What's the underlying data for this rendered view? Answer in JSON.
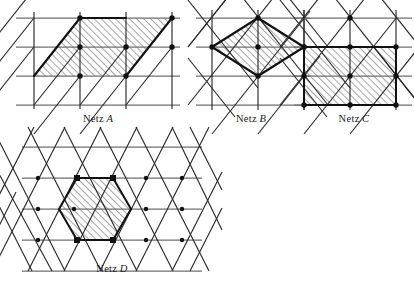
{
  "figure": {
    "background": "#ffffff",
    "ink": "#1b1b1b",
    "grid_gray": "#6f6f6f",
    "hatch_color": "#3a3a3a",
    "panels": [
      {
        "id": "netz-a",
        "caption_prefix": "Netz",
        "caption_letter": "A",
        "lattice": "oblique",
        "cell_label": "parallelogram",
        "x": 14,
        "y": 10,
        "w": 168,
        "h": 100,
        "caption_x": 14,
        "caption_y": 113,
        "caption_w": 168,
        "cols": 3,
        "rows": 3,
        "cell_w": 46,
        "cell_h": 29,
        "shaded_cells": [
          [
            1,
            0
          ],
          [
            2,
            0
          ],
          [
            1,
            1
          ],
          [
            2,
            1
          ]
        ],
        "node_count": 6
      },
      {
        "id": "netz-b",
        "caption_prefix": "Netz",
        "caption_letter": "B",
        "lattice": "rectangular-centered",
        "cell_label": "rhombus",
        "x": 200,
        "y": 10,
        "w": 110,
        "h": 100,
        "caption_x": 196,
        "caption_y": 113,
        "caption_w": 110,
        "cols": 2,
        "rows": 3,
        "cell_w": 46,
        "cell_h": 29,
        "node_count": 5
      },
      {
        "id": "netz-c",
        "caption_prefix": "Netz",
        "caption_letter": "C",
        "lattice": "rectangular-centered",
        "cell_label": "rectangle",
        "x": 300,
        "y": 10,
        "w": 108,
        "h": 100,
        "caption_x": 304,
        "caption_y": 113,
        "caption_w": 100,
        "cols": 2,
        "rows": 3,
        "cell_w": 46,
        "cell_h": 29,
        "node_count": 6
      },
      {
        "id": "netz-d",
        "caption_prefix": "Netz",
        "caption_letter": "D",
        "lattice": "triangular",
        "cell_label": "hexagon",
        "x": 22,
        "y": 152,
        "w": 180,
        "h": 108,
        "caption_x": 22,
        "caption_y": 263,
        "caption_w": 180,
        "cols": 5,
        "rows": 4,
        "cell_w": 36,
        "cell_h": 28,
        "node_count": 6
      }
    ]
  }
}
